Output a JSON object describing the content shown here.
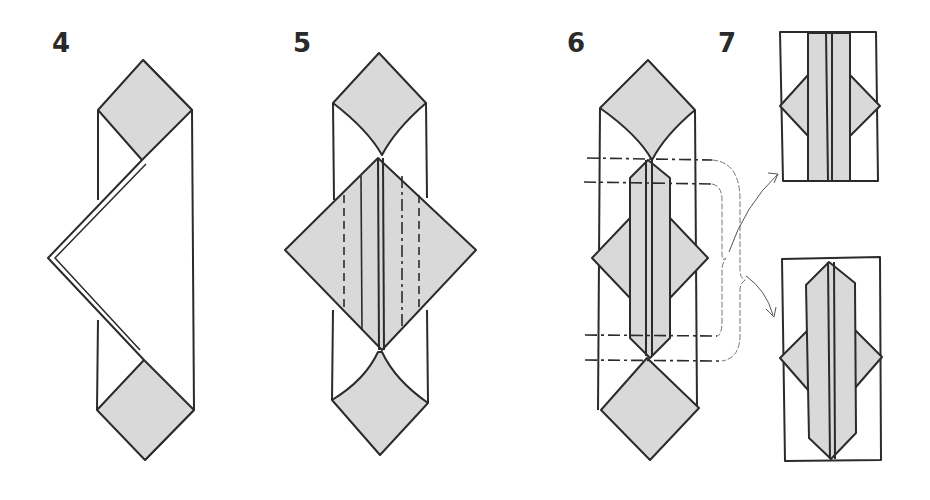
{
  "diagram": {
    "steps": [
      {
        "number": "4",
        "description": "Strip with shaded corners top and bottom, left side folded out into a point"
      },
      {
        "number": "5",
        "description": "Shaded diamond in center with valley and mountain fold lines"
      },
      {
        "number": "6",
        "description": "Narrow center panel with horizontal mountain fold lines, bracketed arrows to results"
      },
      {
        "number": "7",
        "description": "Two resulting rectangular folded forms"
      }
    ],
    "colors": {
      "outline": "#2b2b2b",
      "shade": "#d9d9d9",
      "background": "#ffffff"
    },
    "legend": {
      "valley_fold": "dashed line",
      "mountain_fold": "dash-dot line"
    }
  }
}
